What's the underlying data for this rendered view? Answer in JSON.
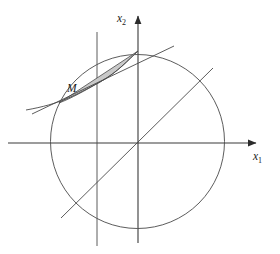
{
  "figure": {
    "title": "",
    "background_color": "#ffffff",
    "width": 280,
    "height": 254
  },
  "axes": {
    "x1": {
      "label_main": "x",
      "label_sub": "1",
      "label_x": 253,
      "label_y": 160,
      "line": {
        "x1": 8,
        "y1": 143,
        "x2": 258,
        "y2": 143
      },
      "arrow": "arrow-right",
      "color": "#3a3a3a"
    },
    "x2": {
      "label_main": "x",
      "label_sub": "2",
      "label_x": 117,
      "label_y": 22,
      "line": {
        "x1": 138,
        "y1": 243,
        "x2": 138,
        "y2": 14
      },
      "arrow": "arrow-up",
      "color": "#3a3a3a"
    }
  },
  "circle": {
    "name": "unit-circle",
    "cx": 137.5,
    "cy": 141.5,
    "r": 87,
    "stroke": "#4a4a4a",
    "stroke_width": 0.9,
    "fill": "none"
  },
  "diagonal_line": {
    "name": "diagonal-line",
    "x1": 61,
    "y1": 218,
    "x2": 213,
    "y2": 68,
    "stroke": "#4a4a4a",
    "stroke_width": 0.9
  },
  "vertical_line": {
    "name": "vertical-constraint-line",
    "x1": 97,
    "y1": 32,
    "x2": 97,
    "y2": 246,
    "stroke": "#4a4a4a",
    "stroke_width": 0.9
  },
  "tangent_line": {
    "name": "tangent-line",
    "x1": 32,
    "y1": 114,
    "x2": 174,
    "y2": 46,
    "stroke": "#4a4a4a",
    "stroke_width": 0.9
  },
  "s_curve": {
    "name": "s-shaped-curve",
    "path": "M 26 110 C 60 104, 74 96, 100 82 C 118 72, 128 60, 138 51",
    "stroke": "#4a4a4a",
    "stroke_width": 0.9
  },
  "region": {
    "name": "shaded-region-M",
    "label": "M",
    "label_x": 67,
    "label_y": 92,
    "fill": "#c9c9c9",
    "fill_opacity": 1,
    "stroke": "#4a4a4a",
    "stroke_width": 0.8,
    "path": "M 59 103 L 138 51 C 128 60, 118 72, 100 82 C 84 91, 72 98, 59 103 Z"
  },
  "colors": {
    "stroke": "#4a4a4a",
    "axis": "#3a3a3a",
    "shade": "#c9c9c9",
    "text": "#1a1a1a",
    "background": "#ffffff"
  }
}
